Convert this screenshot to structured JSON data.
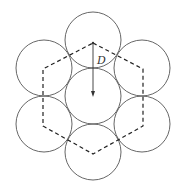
{
  "diagram": {
    "label_D": "D",
    "colors": {
      "circle_stroke": "#555555",
      "hexagon_stroke": "#222222",
      "arrow": "#333333"
    },
    "center_circle": {
      "cx": 93,
      "cy": 96,
      "r": 28
    },
    "outer_circles": [
      {
        "name": "top",
        "cx": 93,
        "cy": 40
      },
      {
        "name": "upper-left",
        "cx": 44,
        "cy": 68
      },
      {
        "name": "upper-right",
        "cx": 142,
        "cy": 68
      },
      {
        "name": "lower-left",
        "cx": 44,
        "cy": 124
      },
      {
        "name": "lower-right",
        "cx": 142,
        "cy": 124
      },
      {
        "name": "bottom",
        "cx": 93,
        "cy": 152
      }
    ],
    "hexagon_points": "93,43 143,69 143,126 93,154 43,126 43,69"
  }
}
